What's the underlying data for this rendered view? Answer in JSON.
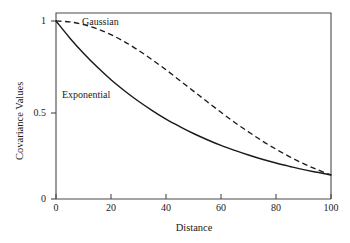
{
  "chart_data": {
    "type": "line",
    "title": "",
    "xlabel": "Distance",
    "ylabel": "Covariance Values",
    "xlim": [
      0,
      100
    ],
    "ylim": [
      0,
      1
    ],
    "xticks": [
      0,
      20,
      40,
      60,
      80,
      100
    ],
    "xticklabels": [
      "0",
      "20",
      "40",
      "60",
      "80",
      "100"
    ],
    "yticks": [
      0,
      0.5,
      1
    ],
    "yticklabels": [
      "0",
      "0.5",
      "1"
    ],
    "grid": false,
    "legend_position": "inline-annotations",
    "background_color": "#ffffff",
    "axis_color": "#4a4a4a",
    "series": [
      {
        "name": "Gaussian",
        "style": "dashed",
        "color": "#1a1a1a",
        "label_text": "Gaussian",
        "x": [
          0,
          5,
          10,
          15,
          20,
          25,
          30,
          35,
          40,
          45,
          50,
          55,
          60,
          65,
          70,
          75,
          80,
          85,
          90,
          95,
          100
        ],
        "y": [
          1.0,
          0.995,
          0.98,
          0.956,
          0.923,
          0.883,
          0.835,
          0.782,
          0.726,
          0.666,
          0.606,
          0.546,
          0.487,
          0.43,
          0.377,
          0.326,
          0.28,
          0.237,
          0.199,
          0.165,
          0.135
        ]
      },
      {
        "name": "Exponential",
        "style": "solid",
        "color": "#1a1a1a",
        "label_text": "Exponential",
        "x": [
          0,
          5,
          10,
          15,
          20,
          25,
          30,
          35,
          40,
          45,
          50,
          55,
          60,
          65,
          70,
          75,
          80,
          85,
          90,
          95,
          100
        ],
        "y": [
          1.0,
          0.905,
          0.819,
          0.741,
          0.67,
          0.607,
          0.549,
          0.497,
          0.449,
          0.407,
          0.368,
          0.333,
          0.301,
          0.273,
          0.247,
          0.223,
          0.202,
          0.183,
          0.165,
          0.15,
          0.135
        ]
      }
    ],
    "annotations": [
      {
        "text": "Gaussian",
        "x": 50,
        "y": 0.92
      },
      {
        "text": "Exponential",
        "x": 12,
        "y": 0.6
      }
    ]
  },
  "axes": {
    "x_title": "Distance",
    "y_title": "Covariance Values"
  },
  "labels": {
    "gaussian": "Gaussian",
    "exponential": "Exponential",
    "x0": "0",
    "x20": "20",
    "x40": "40",
    "x60": "60",
    "x80": "80",
    "x100": "100",
    "y0": "0",
    "y05": "0.5",
    "y1": "1"
  }
}
